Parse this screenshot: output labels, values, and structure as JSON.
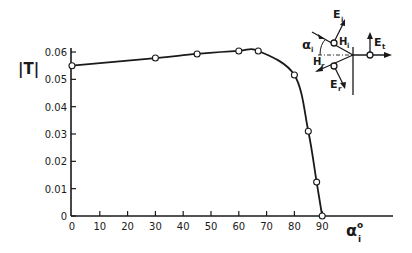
{
  "chart_data": {
    "type": "line",
    "title": "",
    "xlabel": "α_i°",
    "ylabel": "|T|",
    "xlim": [
      0,
      90
    ],
    "ylim": [
      0,
      0.06
    ],
    "grid": false,
    "legend": null,
    "x_ticks": [
      0,
      10,
      20,
      30,
      40,
      50,
      60,
      70,
      80,
      90
    ],
    "x_tick_labels": [
      "0",
      "10",
      "20",
      "30",
      "40",
      "50",
      "60",
      "70",
      "80",
      "90"
    ],
    "y_ticks": [
      0,
      0.01,
      0.02,
      0.03,
      0.04,
      0.05,
      0.06
    ],
    "y_tick_labels": [
      "0",
      "0.01",
      "0.02",
      "0.03",
      "0.04",
      "0.05",
      "0.06"
    ],
    "series": [
      {
        "name": "|T|",
        "marker": "open-circle",
        "x": [
          0,
          30,
          45,
          60,
          67,
          80,
          85,
          88,
          90
        ],
        "values": [
          0.055,
          0.0578,
          0.0593,
          0.0604,
          0.0604,
          0.0516,
          0.031,
          0.0124,
          0.0
        ]
      }
    ],
    "annotations": {
      "inset_diagram": {
        "description": "Oblique incidence geometry at an interface",
        "labels": [
          "E_i",
          "H_i",
          "α_i",
          "H_r",
          "E_r",
          "E_t"
        ]
      }
    }
  },
  "labels": {
    "ylabel_main": "|T|",
    "xlabel_main": "α",
    "xlabel_sub": "i",
    "xlabel_sup": "o",
    "inset": {
      "Ei": "E",
      "Ei_sub": "i",
      "Hi": "H",
      "Hi_sub": "i",
      "alpha": "α",
      "alpha_sub": "i",
      "Hr": "H",
      "Hr_sub": "r",
      "Er": "E",
      "Er_sub": "r",
      "Et": "E",
      "Et_sub": "t"
    }
  }
}
